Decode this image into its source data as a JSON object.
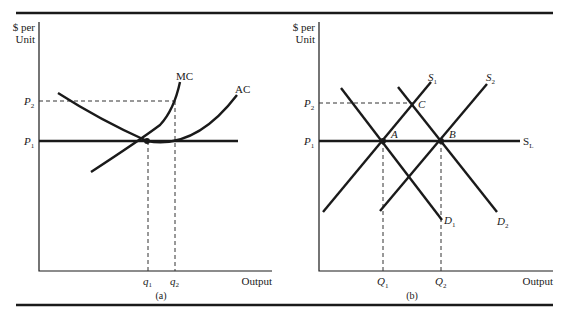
{
  "figure": {
    "top_rule": true,
    "bottom_rule": true
  },
  "panel_a": {
    "caption": "(a)",
    "y_axis_label_line1": "$ per",
    "y_axis_label_line2": "Unit",
    "x_axis_label": "Output",
    "price_labels": {
      "p2": "P",
      "p2_sub": "2",
      "p1": "P",
      "p1_sub": "1"
    },
    "quantity_labels": {
      "q1": "q",
      "q1_sub": "1",
      "q2": "q",
      "q2_sub": "2"
    },
    "curves": {
      "mc": "MC",
      "ac": "AC"
    }
  },
  "panel_b": {
    "caption": "(b)",
    "y_axis_label_line1": "$ per",
    "y_axis_label_line2": "Unit",
    "x_axis_label": "Output",
    "price_labels": {
      "p2": "P",
      "p2_sub": "2",
      "p1": "P",
      "p1_sub": "1"
    },
    "quantity_labels": {
      "q1": "Q",
      "q1_sub": "1",
      "q2": "Q",
      "q2_sub": "2"
    },
    "curves": {
      "s1": "S",
      "s1_sub": "1",
      "s2": "S",
      "s2_sub": "2",
      "sl": "S",
      "sl_sub": "L",
      "d1": "D",
      "d1_sub": "1",
      "d2": "D",
      "d2_sub": "2"
    },
    "points": {
      "a": "A",
      "b": "B",
      "c": "C"
    }
  },
  "colors": {
    "ink": "#1a1a1a",
    "background": "#ffffff"
  }
}
